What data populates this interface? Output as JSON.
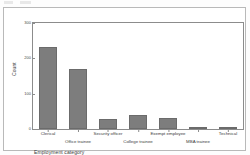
{
  "chart_data": {
    "type": "bar",
    "title": "",
    "subtitle": "",
    "xlabel": "Employment category",
    "ylabel": "Count",
    "categories": [
      "Clerical",
      "Office trainee",
      "Security officer",
      "College trainee",
      "Exempt employee",
      "MBA trainee",
      "Technical"
    ],
    "values": [
      231,
      169,
      27,
      41,
      32,
      2,
      2
    ],
    "ylim": [
      0,
      300
    ],
    "yticks": [
      "0",
      "100",
      "200",
      "300"
    ],
    "ytick_values": [
      0,
      100,
      200,
      300
    ],
    "grid": false,
    "legend": "none",
    "bar_color": "#7d7d7d",
    "bar_border_color": "#6b6b6b",
    "axis_color": "#8c8c8c",
    "frame_color": "#b9b9b9",
    "background": "#ffffff"
  }
}
